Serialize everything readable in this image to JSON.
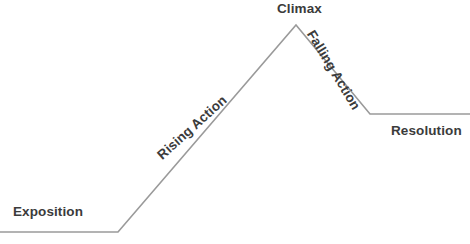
{
  "diagram": {
    "type": "freytag-pyramid",
    "background_color": "#ffffff",
    "line_color": "#9a9a9a",
    "text_color": "#3b3b3b",
    "line_width": 1.6,
    "canvas": {
      "width": 470,
      "height": 244
    },
    "path_points": [
      {
        "name": "left-baseline-start",
        "x": 0,
        "y": 232
      },
      {
        "name": "exposition-bend",
        "x": 118,
        "y": 232
      },
      {
        "name": "climax-apex",
        "x": 296,
        "y": 25
      },
      {
        "name": "resolution-bend",
        "x": 370,
        "y": 114
      },
      {
        "name": "right-baseline-end",
        "x": 470,
        "y": 114
      }
    ],
    "labels": [
      {
        "key": "exposition",
        "text": "Exposition",
        "rotation_deg": 0,
        "x": 13,
        "y": 205
      },
      {
        "key": "rising_action",
        "text": "Rising Action",
        "rotation_deg": -42,
        "x": 155,
        "y": 152
      },
      {
        "key": "climax",
        "text": "Climax",
        "rotation_deg": 0,
        "x": 277,
        "y": 2
      },
      {
        "key": "falling_action",
        "text": "Falling Action",
        "rotation_deg": 59,
        "x": 316,
        "y": 28
      },
      {
        "key": "resolution",
        "text": "Resolution",
        "rotation_deg": 0,
        "x": 391,
        "y": 124
      }
    ],
    "label_text": {
      "exposition": "Exposition",
      "rising_action": "Rising Action",
      "climax": "Climax",
      "falling_action": "Falling Action",
      "resolution": "Resolution"
    }
  }
}
